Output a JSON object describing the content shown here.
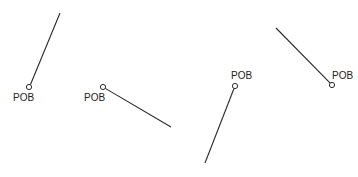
{
  "diagram": {
    "title": "",
    "figures": [
      {
        "id": "fig-1",
        "label": "POB",
        "endpoint": "circle",
        "direction": "up-right"
      },
      {
        "id": "fig-2",
        "label": "POB",
        "endpoint": "circle",
        "direction": "down-right"
      },
      {
        "id": "fig-3",
        "label": "POB",
        "endpoint": "circle",
        "direction": "down-left"
      },
      {
        "id": "fig-4",
        "label": "POB",
        "endpoint": "circle",
        "direction": "up-left"
      }
    ],
    "colors": {
      "line": "#2a2a2a",
      "text": "#222222",
      "background": "#ffffff"
    }
  }
}
